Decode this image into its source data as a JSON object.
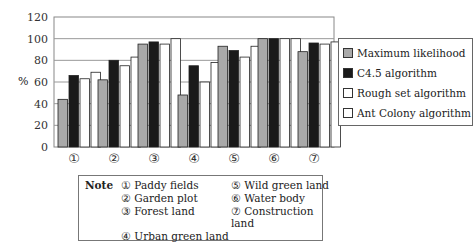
{
  "chart_data": {
    "type": "bar",
    "title": "",
    "xlabel": "",
    "ylabel": "%",
    "ylim": [
      0,
      120
    ],
    "yticks": [
      0,
      20,
      40,
      60,
      80,
      100,
      120
    ],
    "grid": true,
    "legend_position": "right",
    "categories": [
      "①",
      "②",
      "③",
      "④",
      "⑤",
      "⑥",
      "⑦"
    ],
    "series": [
      {
        "name": "Maximum likelihood",
        "color": "#a9a9a9",
        "values": [
          44,
          62,
          95,
          48,
          93,
          100,
          88
        ]
      },
      {
        "name": "C4.5 algorithm",
        "color": "#1a1a1a",
        "values": [
          66,
          80,
          97,
          75,
          89,
          100,
          96
        ]
      },
      {
        "name": "Rough set algorithm",
        "color": "#ffffff",
        "values": [
          63,
          75,
          95,
          60,
          83,
          100,
          95
        ]
      },
      {
        "name": "Ant Colony algorithm",
        "color": "#ffffff",
        "values": [
          69,
          83,
          100,
          78,
          93,
          100,
          97
        ]
      }
    ]
  },
  "note": {
    "label": "Note",
    "items": [
      "① Paddy fields",
      "② Garden plot",
      "③ Forest land",
      "④ Urban green land",
      "⑤ Wild green land",
      "⑥ Water body",
      "⑦ Construction land"
    ]
  }
}
